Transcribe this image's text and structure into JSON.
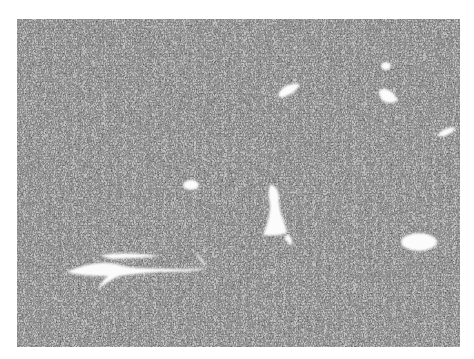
{
  "image": {
    "kind": "histology-micrograph",
    "description": "Grayscale photomicrograph of a densely cellular spindle-cell tissue with scattered white vascular spaces",
    "border_color": "#ffffff",
    "tissue_base_color": "#c9c9c9",
    "nuclei_color": "#2e2e2e",
    "lumen_color": "#fbfbfb",
    "bounds": {
      "x": 17,
      "y": 19,
      "width": 443,
      "height": 328
    }
  },
  "vessels": [
    {
      "id": "vessel-staghorn-lower-left",
      "shape": "branching",
      "approx_x": 65,
      "approx_y": 240,
      "approx_w": 145,
      "approx_h": 40
    },
    {
      "id": "vessel-center-elongated",
      "shape": "elongated",
      "approx_x": 262,
      "approx_y": 183,
      "approx_w": 26,
      "approx_h": 65
    },
    {
      "id": "vessel-right-oval",
      "shape": "oval",
      "approx_x": 402,
      "approx_y": 232,
      "approx_w": 36,
      "approx_h": 20
    },
    {
      "id": "vessel-upper-center-small",
      "shape": "oval",
      "approx_x": 280,
      "approx_y": 84,
      "approx_w": 22,
      "approx_h": 14
    },
    {
      "id": "vessel-upper-right-1",
      "shape": "oval",
      "approx_x": 379,
      "approx_y": 87,
      "approx_w": 20,
      "approx_h": 17
    },
    {
      "id": "vessel-upper-right-2",
      "shape": "oval",
      "approx_x": 380,
      "approx_y": 64,
      "approx_w": 12,
      "approx_h": 8
    },
    {
      "id": "vessel-far-right",
      "shape": "oval",
      "approx_x": 438,
      "approx_y": 128,
      "approx_w": 18,
      "approx_h": 10
    },
    {
      "id": "vessel-mid-left-small",
      "shape": "oval",
      "approx_x": 183,
      "approx_y": 180,
      "approx_w": 16,
      "approx_h": 10
    }
  ]
}
